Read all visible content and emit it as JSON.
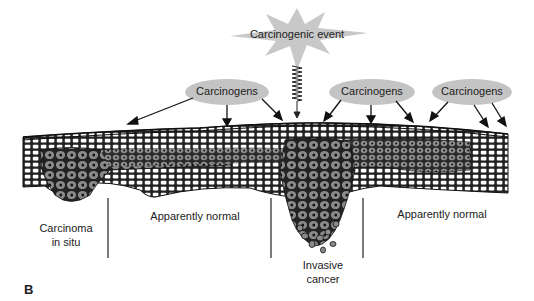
{
  "figure": {
    "panel_label": "B",
    "event": {
      "label": "Carcinogenic event"
    },
    "carcinogens": [
      {
        "label": "Carcinogens"
      },
      {
        "label": "Carcinogens"
      },
      {
        "label": "Carcinogens"
      }
    ],
    "regions": {
      "carcinoma_in_situ": {
        "line1": "Carcinoma",
        "line2": "in situ"
      },
      "normal_left": {
        "label": "Apparently normal"
      },
      "invasive": {
        "line1": "Invasive",
        "line2": "cancer"
      },
      "normal_right": {
        "label": "Apparently normal"
      }
    },
    "colors": {
      "burst": "#c8c8c8",
      "ellipse": "#c4c4c4",
      "tumor_cell": "#8a8a8a",
      "tissue_dark": "#333333"
    }
  }
}
